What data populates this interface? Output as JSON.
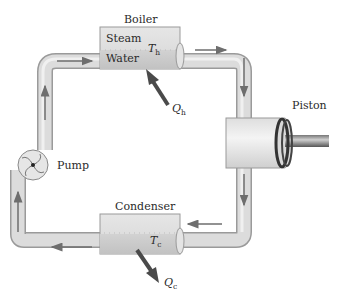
{
  "diagram": {
    "labels": {
      "boiler": "Boiler",
      "steam": "Steam",
      "water": "Water",
      "boiler_temp_var": "T",
      "boiler_temp_sub": "h",
      "heat_in_var": "Q",
      "heat_in_sub": "h",
      "pump": "Pump",
      "piston": "Piston",
      "condenser": "Condenser",
      "condenser_temp_var": "T",
      "condenser_temp_sub": "c",
      "heat_out_var": "Q",
      "heat_out_sub": "c"
    },
    "components": [
      {
        "id": "boiler",
        "label": "Boiler",
        "contains": [
          "Steam",
          "Water"
        ],
        "temperature": "Th",
        "heat": "Qh (in)"
      },
      {
        "id": "piston",
        "label": "Piston"
      },
      {
        "id": "condenser",
        "label": "Condenser",
        "temperature": "Tc",
        "heat": "Qc (out)"
      },
      {
        "id": "pump",
        "label": "Pump"
      }
    ],
    "flow": [
      "Pump",
      "Boiler",
      "Piston",
      "Condenser",
      "Pump"
    ],
    "colors": {
      "pipe_fill": "#dcdcdc",
      "pipe_edge": "#9a9a9a",
      "pipe_highlight": "#f2f2f2",
      "flow_arrow": "#6e6e6e",
      "heat_arrow": "#4a4a4a",
      "piston_rod": "#5a5a5a",
      "background": "#ffffff"
    }
  }
}
